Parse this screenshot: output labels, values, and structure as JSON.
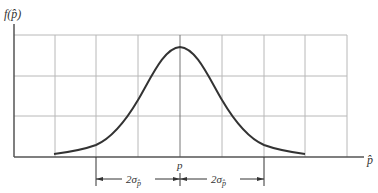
{
  "figure": {
    "y_axis_label": "f(p̂)",
    "x_axis_label": "p̂",
    "center_label": "p",
    "left_span_label": "2σ",
    "left_span_sub": "p̂",
    "right_span_label": "2σ",
    "right_span_sub": "p̂"
  },
  "colors": {
    "curve": "#333333",
    "axis": "#555555",
    "grid": "#b8b8b8",
    "background": "#ffffff"
  },
  "grid": {
    "vertical_lines_x": [
      55,
      96,
      138,
      180,
      222,
      264,
      305,
      347
    ],
    "horizontal_lines_y": [
      35,
      76,
      116
    ]
  },
  "curve": {
    "type": "normal-density",
    "center_x": 180,
    "peak_y": 47,
    "tail_left_x": 54,
    "tail_right_x": 305
  }
}
